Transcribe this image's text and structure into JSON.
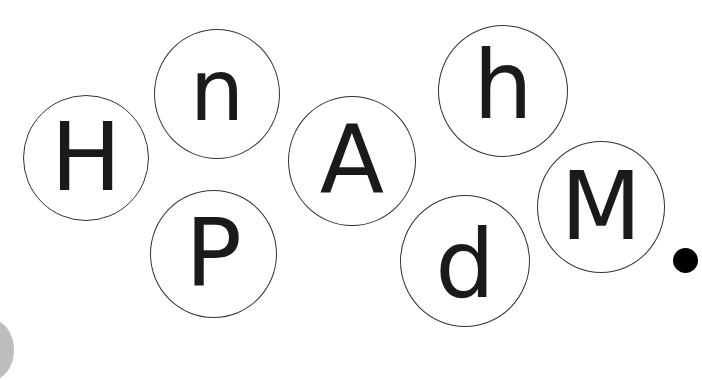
{
  "letters": [
    {
      "char": "H",
      "cx": 86,
      "cy": 158,
      "r": 63,
      "size": 94
    },
    {
      "char": "n",
      "cx": 217,
      "cy": 94,
      "r": 63,
      "size": 86
    },
    {
      "char": "P",
      "cx": 213,
      "cy": 254,
      "r": 63,
      "size": 94
    },
    {
      "char": "A",
      "cx": 350,
      "cy": 160,
      "r": 64,
      "size": 94
    },
    {
      "char": "h",
      "cx": 503,
      "cy": 91,
      "r": 64,
      "size": 94
    },
    {
      "char": "d",
      "cx": 465,
      "cy": 260,
      "r": 64,
      "size": 94
    },
    {
      "char": "M",
      "cx": 601,
      "cy": 207,
      "r": 63,
      "size": 94
    }
  ],
  "period": {
    "char": ".",
    "cx": 685,
    "cy": 260,
    "r": 12
  }
}
